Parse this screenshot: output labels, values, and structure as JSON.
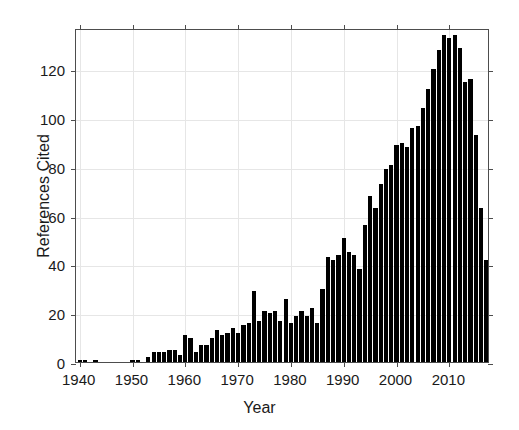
{
  "chart_data": {
    "type": "bar",
    "title": "",
    "xlabel": "Year",
    "ylabel": "References Cited",
    "xlim": [
      1939.3,
      2017.7
    ],
    "ylim": [
      0,
      137
    ],
    "grid": true,
    "legend": null,
    "x_ticks": [
      1940,
      1950,
      1960,
      1970,
      1980,
      1990,
      2000,
      2010
    ],
    "x_tick_labels": [
      "1940",
      "1950",
      "1960",
      "1970",
      "1980",
      "1990",
      "2000",
      "2010"
    ],
    "y_ticks": [
      0,
      20,
      40,
      60,
      80,
      100,
      120
    ],
    "y_tick_labels": [
      "0",
      "20",
      "40",
      "60",
      "80",
      "100",
      "120"
    ],
    "bar_color": "#000000",
    "categories": [
      1940,
      1941,
      1942,
      1943,
      1944,
      1945,
      1946,
      1947,
      1948,
      1949,
      1950,
      1951,
      1952,
      1953,
      1954,
      1955,
      1956,
      1957,
      1958,
      1959,
      1960,
      1961,
      1962,
      1963,
      1964,
      1965,
      1966,
      1967,
      1968,
      1969,
      1970,
      1971,
      1972,
      1973,
      1974,
      1975,
      1976,
      1977,
      1978,
      1979,
      1980,
      1981,
      1982,
      1983,
      1984,
      1985,
      1986,
      1987,
      1988,
      1989,
      1990,
      1991,
      1992,
      1993,
      1994,
      1995,
      1996,
      1997,
      1998,
      1999,
      2000,
      2001,
      2002,
      2003,
      2004,
      2005,
      2006,
      2007,
      2008,
      2009,
      2010,
      2011,
      2012,
      2013,
      2014,
      2015,
      2016,
      2017
    ],
    "values": [
      1,
      1,
      0,
      1,
      0,
      0,
      0,
      0,
      0,
      0,
      1,
      1,
      0,
      2,
      4,
      4,
      4,
      5,
      5,
      3,
      11,
      10,
      4,
      7,
      7,
      10,
      13,
      11,
      12,
      14,
      12,
      15,
      16,
      29,
      17,
      21,
      20,
      21,
      17,
      26,
      16,
      19,
      21,
      19,
      22,
      16,
      30,
      43,
      42,
      44,
      51,
      45,
      44,
      38,
      56,
      68,
      63,
      73,
      79,
      81,
      89,
      90,
      88,
      96,
      97,
      104,
      112,
      120,
      128,
      134,
      133,
      134,
      129,
      115,
      116,
      93,
      63,
      42
    ]
  }
}
